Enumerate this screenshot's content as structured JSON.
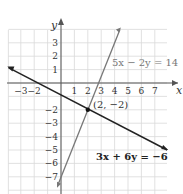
{
  "chart_data": {
    "type": "line",
    "title": "",
    "xlabel": "x",
    "ylabel": "y",
    "xlim": [
      -4,
      8
    ],
    "ylim": [
      -8,
      4
    ],
    "grid": true,
    "x_ticks": [
      -3,
      -2,
      1,
      2,
      3,
      4,
      5,
      6,
      7
    ],
    "y_ticks": [
      3,
      2,
      1,
      -2,
      -3,
      -4,
      -5,
      -6,
      -7
    ],
    "series": [
      {
        "name": "5x − 2y = 14",
        "equation": "y = 2.5x - 7",
        "x": [
          0,
          4.4
        ],
        "y": [
          -7,
          4
        ],
        "color": "#777777"
      },
      {
        "name": "3x + 6y = −6",
        "equation": "y = -0.5x - 1",
        "x": [
          -4,
          8
        ],
        "y": [
          1,
          -5
        ],
        "color": "#222222"
      }
    ],
    "annotations": [
      {
        "text": "(2, −2)",
        "x": 2,
        "y": -2,
        "type": "intersection-point"
      },
      {
        "text": "5x − 2y = 14",
        "type": "line-label"
      },
      {
        "text": "3x + 6y = −6",
        "type": "line-label"
      }
    ]
  },
  "labels": {
    "x_axis": "x",
    "y_axis": "y",
    "line1": "5x − 2y = 14",
    "line2": "3x + 6y = −6",
    "point": "(2, −2)"
  },
  "colors": {
    "grid": "#d9d9d9",
    "axis": "#555555",
    "line1": "#777777",
    "line2": "#222222"
  }
}
